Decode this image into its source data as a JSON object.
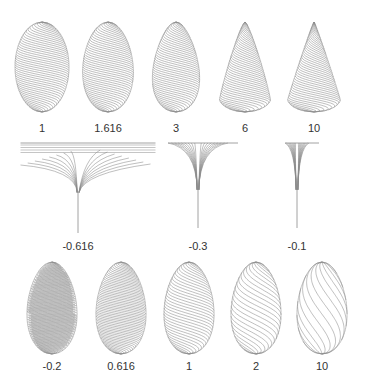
{
  "figure": {
    "line_color": "#8a8a8a",
    "outline_color": "#b0b0b0",
    "background": "#ffffff",
    "rows": [
      {
        "name": "top-row",
        "label_y": 122,
        "items": [
          {
            "label": "1",
            "cx": 42,
            "kind": "ellipse",
            "taper": 0.0,
            "tilt": 1.0
          },
          {
            "label": "1.616",
            "cx": 108,
            "kind": "egg",
            "taper": 0.25,
            "tilt": 1.0
          },
          {
            "label": "3",
            "cx": 176,
            "kind": "egg",
            "taper": 0.55,
            "tilt": 1.0
          },
          {
            "label": "6",
            "cx": 245,
            "kind": "cone",
            "taper": 0.85,
            "tilt": 1.0
          },
          {
            "label": "10",
            "cx": 314,
            "kind": "cone",
            "taper": 0.95,
            "tilt": 1.0
          }
        ]
      },
      {
        "name": "middle-row",
        "label_y": 240,
        "items": [
          {
            "label": "-0.616",
            "cx": 78,
            "kind": "funnel",
            "width": 115,
            "depth": 90
          },
          {
            "label": "-0.3",
            "cx": 198,
            "kind": "funnel",
            "width": 60,
            "depth": 85
          },
          {
            "label": "-0.1",
            "cx": 297,
            "kind": "funnel",
            "width": 24,
            "depth": 85
          }
        ]
      },
      {
        "name": "bottom-row",
        "label_y": 360,
        "items": [
          {
            "label": "-0.2",
            "cx": 52,
            "kind": "egg",
            "taper": 0.3,
            "tilt": 0.35
          },
          {
            "label": "0.616",
            "cx": 121,
            "kind": "egg",
            "taper": 0.3,
            "tilt": 0.75
          },
          {
            "label": "1",
            "cx": 189,
            "kind": "egg",
            "taper": 0.3,
            "tilt": 1.3
          },
          {
            "label": "2",
            "cx": 256,
            "kind": "egg",
            "taper": 0.3,
            "tilt": 2.2
          },
          {
            "label": "10",
            "cx": 322,
            "kind": "egg",
            "taper": 0.3,
            "tilt": 6.0
          }
        ]
      }
    ]
  }
}
